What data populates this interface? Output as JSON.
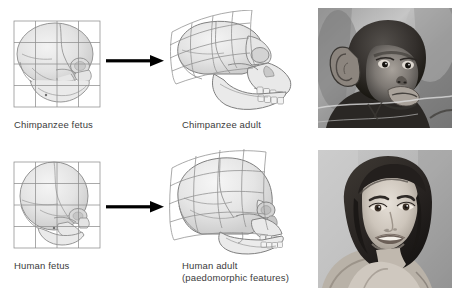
{
  "figure": {
    "background_color": "#ffffff",
    "caption_color": "#3b3b3b",
    "arrow_color": "#000000",
    "grid_color": "#8a8a8a",
    "skull_outline_color": "#7d7d7d",
    "skull_fill_color": "#e8e8e8",
    "layout": "2 rows x 4 columns: fetus skull, arrow, adult skull, photograph"
  },
  "rows": [
    {
      "id": "chimpanzee-row",
      "species": "Chimpanzee",
      "fetus": {
        "label": "Chimpanzee fetus",
        "grid_type": "regular",
        "grid_columns": 4,
        "grid_rows": 4
      },
      "arrow": {
        "name": "transformation-arrow",
        "direction": "right"
      },
      "adult": {
        "label": "Chimpanzee adult",
        "grid_type": "deformed",
        "grid_columns": 4,
        "grid_rows": 4
      },
      "photo": {
        "label": "Chimpanzee photograph",
        "subject": "juvenile chimpanzee",
        "color_mode": "grayscale"
      }
    },
    {
      "id": "human-row",
      "species": "Human",
      "fetus": {
        "label": "Human fetus",
        "grid_type": "regular",
        "grid_columns": 4,
        "grid_rows": 4
      },
      "arrow": {
        "name": "transformation-arrow",
        "direction": "right"
      },
      "adult": {
        "label": "Human adult\n(paedomorphic features)",
        "label_line_1": "Human adult",
        "label_line_2": "(paedomorphic features)",
        "grid_type": "deformed",
        "grid_columns": 4,
        "grid_rows": 4
      },
      "photo": {
        "label": "Human photograph",
        "subject": "adult woman portrait",
        "color_mode": "grayscale"
      }
    }
  ]
}
